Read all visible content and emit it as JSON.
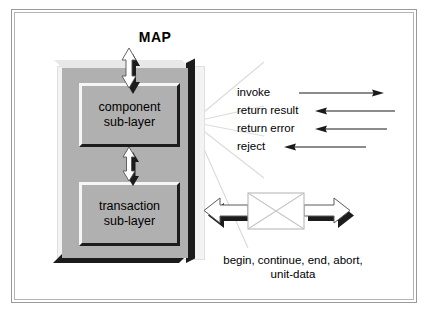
{
  "diagram": {
    "title": "MAP",
    "layers": [
      {
        "id": "component",
        "line1": "component",
        "line2": "sub-layer"
      },
      {
        "id": "transaction",
        "line1": "transaction",
        "line2": "sub-layer"
      }
    ],
    "signals": [
      {
        "label": "invoke",
        "direction": "right"
      },
      {
        "label": "return result",
        "direction": "left"
      },
      {
        "label": "return error",
        "direction": "left"
      },
      {
        "label": "reject",
        "direction": "left"
      }
    ],
    "primitives": {
      "line1": "begin, continue, end, abort,",
      "line2": "unit-data"
    },
    "colors": {
      "container_gray": "#b0b0b0",
      "shadow_black": "#1c1c1c",
      "highlight_white": "#f6f6f6",
      "frame_gray": "#9a9a9a",
      "text_black": "#000000",
      "guide_gray": "#d8d8d8"
    },
    "icons": {
      "vertical_arrow": "double-headed-vertical-arrow",
      "horizontal_arrow": "double-headed-horizontal-arrow",
      "envelope": "envelope-icon"
    }
  }
}
